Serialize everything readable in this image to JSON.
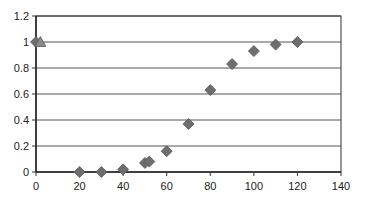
{
  "chart_data": {
    "type": "scatter",
    "title": "",
    "xlabel": "",
    "ylabel": "",
    "xlim": [
      0,
      140
    ],
    "ylim": [
      0,
      1.2
    ],
    "x_ticks": [
      "0",
      "20",
      "40",
      "60",
      "80",
      "100",
      "120",
      "140"
    ],
    "y_ticks": [
      "0",
      "0.2",
      "0.4",
      "0.6",
      "0.8",
      "1",
      "1.2"
    ],
    "grid": "horizontal",
    "legend": null,
    "series": [
      {
        "name": "series-diamond",
        "marker": "diamond",
        "color": "#6e6e6e",
        "points": [
          [
            0,
            1.0
          ],
          [
            20,
            0.0
          ],
          [
            30,
            0.0
          ],
          [
            40,
            0.02
          ],
          [
            50,
            0.07
          ],
          [
            52,
            0.08
          ],
          [
            60,
            0.16
          ],
          [
            70,
            0.37
          ],
          [
            80,
            0.63
          ],
          [
            90,
            0.83
          ],
          [
            100,
            0.93
          ],
          [
            110,
            0.98
          ],
          [
            120,
            1.0
          ]
        ]
      },
      {
        "name": "series-triangle",
        "marker": "triangle",
        "color": "#8a8a8a",
        "points": [
          [
            2,
            1.0
          ]
        ]
      }
    ]
  }
}
